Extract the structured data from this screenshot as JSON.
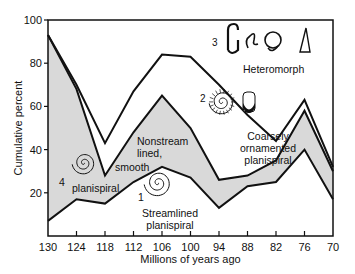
{
  "chart_data": {
    "type": "area",
    "title": "",
    "xlabel": "Millions of years ago",
    "ylabel": "Cumulative percent",
    "x": [
      130,
      124,
      118,
      112,
      106,
      100,
      94,
      88,
      82,
      76,
      70
    ],
    "xticks": [
      "130",
      "124",
      "118",
      "112",
      "106",
      "100",
      "94",
      "88",
      "82",
      "76",
      "70"
    ],
    "yticks": [
      "20",
      "40",
      "60",
      "80",
      "100"
    ],
    "ylim": [
      0,
      100
    ],
    "grid": false,
    "stacked": true,
    "series": [
      {
        "name": "1 Streamlined planispiral",
        "fill": "#ffffff",
        "values": [
          7,
          17,
          15,
          25,
          32,
          27,
          13,
          23,
          25,
          40,
          17
        ]
      },
      {
        "name": "4 Nonstreamlined, smooth planispiral",
        "fill": "#d9d9d9",
        "values": [
          93,
          68,
          28,
          48,
          65,
          50,
          26,
          28,
          35,
          58,
          30
        ]
      },
      {
        "name": "2 Coarsely ornamented planispiral",
        "fill": "#ffffff",
        "values": [
          93,
          70,
          43,
          67,
          84,
          83,
          70,
          56,
          44,
          63,
          32
        ]
      },
      {
        "name": "3 Heteromorph",
        "fill": "#ffffff",
        "values": [
          100,
          100,
          100,
          100,
          100,
          100,
          100,
          100,
          100,
          100,
          100
        ]
      }
    ],
    "annotations": [
      {
        "num": "1",
        "text": "Streamlined planispiral"
      },
      {
        "num": "2",
        "text": "Coarsely ornamented planispiral"
      },
      {
        "num": "3",
        "text": "Heteromorph"
      },
      {
        "num": "4",
        "text": "Nonstreamlined, smooth planispiral"
      }
    ]
  },
  "labels": {
    "heteromorph": "Heteromorph",
    "num3": "3",
    "num2": "2",
    "num1": "1",
    "num4": "4",
    "coarse1": "Coarsely",
    "coarse2": "ornamented",
    "coarse3": "planispiral",
    "nonstream1": "Nonstream",
    "nonstream2": "lined,",
    "smooth": "smooth",
    "planispiral4": "planispiral",
    "stream1": "Streamlined",
    "stream2": "planispiral"
  }
}
